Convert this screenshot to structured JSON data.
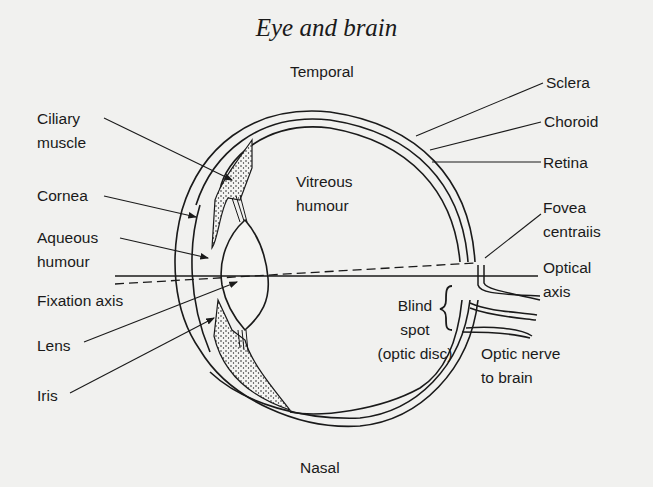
{
  "title": "Eye and brain",
  "orientation": {
    "top": "Temporal",
    "bottom": "Nasal"
  },
  "labels_left": [
    {
      "id": "ciliary-muscle",
      "text": "Ciliary\nmuscle"
    },
    {
      "id": "cornea",
      "text": "Cornea"
    },
    {
      "id": "aqueous-humour",
      "text": "Aqueous\nhumour"
    },
    {
      "id": "fixation-axis",
      "text": "Fixation axis"
    },
    {
      "id": "lens",
      "text": "Lens"
    },
    {
      "id": "iris",
      "text": "Iris"
    }
  ],
  "labels_right": [
    {
      "id": "sclera",
      "text": "Sclera"
    },
    {
      "id": "choroid",
      "text": "Choroid"
    },
    {
      "id": "retina",
      "text": "Retina"
    },
    {
      "id": "fovea-centralis",
      "text": "Fovea\ncentraiis"
    },
    {
      "id": "optical-axis",
      "text": "Optical\naxis"
    },
    {
      "id": "optic-nerve",
      "text": "Optic nerve\nto brain"
    }
  ],
  "labels_inner": [
    {
      "id": "vitreous-humour",
      "text": "Vitreous\nhumour"
    },
    {
      "id": "blind-spot",
      "text": "Blind\nspot\n(optic disc)"
    }
  ],
  "colors": {
    "background": "#f1f1ef",
    "ink": "#1a1a1a"
  }
}
